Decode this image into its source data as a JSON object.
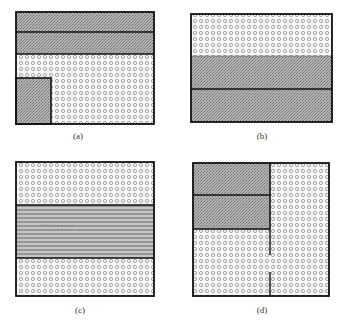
{
  "panels": [
    {
      "id": "a",
      "label": "(a)",
      "regions": [
        {
          "name": "top-strip-1",
          "fill": "dark"
        },
        {
          "name": "top-strip-2",
          "fill": "dark"
        },
        {
          "name": "lower-area",
          "fill": "light"
        },
        {
          "name": "corner-block",
          "fill": "dark"
        }
      ]
    },
    {
      "id": "b",
      "label": "(b)",
      "regions": [
        {
          "name": "top-band",
          "fill": "light"
        },
        {
          "name": "middle-band",
          "fill": "dark"
        },
        {
          "name": "bottom-band",
          "fill": "dark"
        }
      ]
    },
    {
      "id": "c",
      "label": "(c)",
      "regions": [
        {
          "name": "top-band",
          "fill": "light"
        },
        {
          "name": "middle-band",
          "fill": "zigzag"
        },
        {
          "name": "bottom-band",
          "fill": "light"
        }
      ]
    },
    {
      "id": "d",
      "label": "(d)",
      "regions": [
        {
          "name": "upper-left-block-1",
          "fill": "dark"
        },
        {
          "name": "upper-left-block-2",
          "fill": "dark"
        },
        {
          "name": "lower-left-area",
          "fill": "light"
        },
        {
          "name": "right-column",
          "fill": "light"
        }
      ]
    }
  ],
  "colors": {
    "stroke": "#111111",
    "dark_fill": "#a8a8a8",
    "light_fill": "#f4f4f4",
    "ring": "#9a9a9a"
  }
}
